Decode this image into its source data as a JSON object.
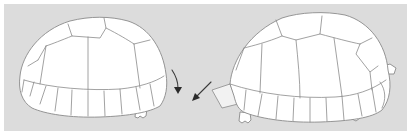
{
  "figure": {
    "background_color": "#dcdcdc",
    "border_color": "#ffffff",
    "line_color": "#8a8a8a",
    "arrow_color": "#2a2a2a"
  },
  "shells": [
    {
      "id": "left-shell",
      "size": "smaller",
      "posterior_marginals": "curved downward (arrow pointing down)"
    },
    {
      "id": "right-shell",
      "size": "larger",
      "posterior_marginals": "flared outward (arrow pointing diagonally)"
    }
  ],
  "arrows": [
    {
      "id": "arrow-left",
      "direction": "down",
      "curved": true
    },
    {
      "id": "arrow-right",
      "direction": "down-left",
      "curved": false
    }
  ]
}
